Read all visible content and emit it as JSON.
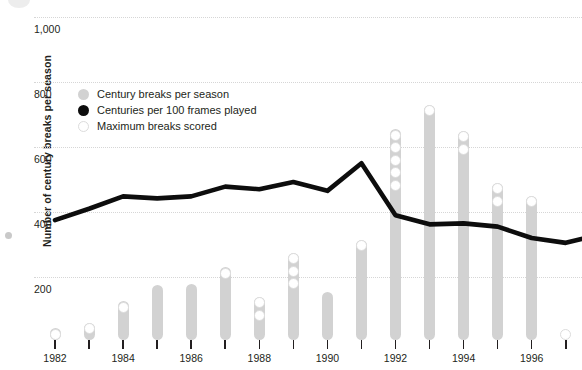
{
  "chart_data": {
    "type": "bar",
    "title": "",
    "xlabel": "",
    "ylabel": "Number of century breaks per season",
    "ylim": [
      0,
      1060
    ],
    "xlim": [
      1981.4,
      1998.6
    ],
    "grid": true,
    "legend_position": "inside-top-left",
    "ytick_labels": [
      "1,000",
      "800",
      "600",
      "400",
      "200"
    ],
    "ytick_values": [
      1000,
      800,
      600,
      400,
      200
    ],
    "xtick_values": [
      1982,
      1983,
      1984,
      1985,
      1986,
      1987,
      1988,
      1989,
      1990,
      1991,
      1992,
      1993,
      1994,
      1995,
      1996,
      1997,
      1998
    ],
    "xtick_labels_shown": [
      "1982",
      "1984",
      "1986",
      "1988",
      "1990",
      "1992",
      "1994",
      "1996"
    ],
    "xtick_labels_values": [
      1982,
      1984,
      1986,
      1988,
      1990,
      1992,
      1994,
      1996
    ],
    "categories": [
      1982,
      1983,
      1984,
      1985,
      1986,
      1987,
      1988,
      1989,
      1990,
      1991,
      1992,
      1993,
      1994,
      1995,
      1996,
      1997,
      1998
    ],
    "series": [
      {
        "name": "Century breaks per season",
        "type": "bar",
        "color": "#d2d2d2",
        "values": [
          42,
          60,
          125,
          175,
          180,
          230,
          140,
          275,
          155,
          315,
          655,
          730,
          650,
          490,
          450,
          0,
          540
        ]
      },
      {
        "name": "Centuries per 100 frames played",
        "type": "line",
        "color": "#0d0d0d",
        "values": [
          375,
          410,
          448,
          442,
          448,
          478,
          470,
          492,
          465,
          550,
          390,
          362,
          365,
          355,
          320,
          305,
          330
        ]
      },
      {
        "name": "Maximum breaks scored",
        "type": "marker-stack",
        "color": "#ffffff",
        "values": [
          1,
          1,
          1,
          0,
          0,
          1,
          2,
          3,
          0,
          1,
          5,
          1,
          2,
          2,
          1,
          1,
          2
        ]
      }
    ],
    "annotations": []
  },
  "legend": {
    "items": [
      {
        "label": "Century breaks per season",
        "swatch": "bar-swatch"
      },
      {
        "label": "Centuries per 100 frames played",
        "swatch": "line-swatch"
      },
      {
        "label": "Maximum breaks scored",
        "swatch": "circle-swatch"
      }
    ]
  },
  "axis": {
    "y_title": "Number of century breaks per season"
  }
}
